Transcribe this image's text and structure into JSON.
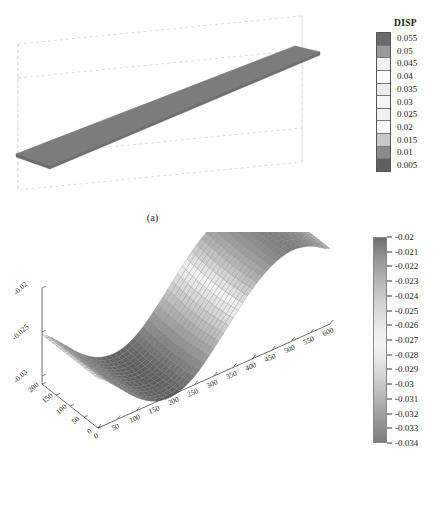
{
  "figure": {
    "panel_a": {
      "caption": "(a)",
      "legend": {
        "title": "DISP",
        "labels": [
          "0.055",
          "0.05",
          "0.045",
          "0.04",
          "0.035",
          "0.03",
          "0.025",
          "0.02",
          "0.015",
          "0.01",
          "0.005"
        ],
        "swatch_colors": [
          "#6b6b6b",
          "#9a9a9a",
          "#f2f2f2",
          "#fbfbfb",
          "#ededed",
          "#f6f6f6",
          "#f0f0f0",
          "#f9f9f9",
          "#c9c9c9",
          "#8a8a8a",
          "#5f5f5f"
        ]
      },
      "surface_color": "#7c7c7c",
      "box_line_color": "#d9d9d9"
    },
    "panel_b": {
      "caption": "(b)",
      "legend": {
        "labels": [
          "-0.02",
          "-0.021",
          "-0.022",
          "-0.023",
          "-0.024",
          "-0.025",
          "-0.026",
          "-0.027",
          "-0.028",
          "-0.029",
          "-0.03",
          "-0.031",
          "-0.032",
          "-0.033",
          "-0.034"
        ]
      },
      "axes": {
        "x_ticks": [
          "0",
          "50",
          "100",
          "150",
          "200",
          "250",
          "300",
          "350",
          "400",
          "450",
          "500",
          "550",
          "600"
        ],
        "y_ticks": [
          "0",
          "50",
          "100",
          "150",
          "200"
        ],
        "z_ticks": [
          "-0.02",
          "-0.025",
          "-0.03"
        ]
      }
    }
  },
  "chart_data": [
    {
      "type": "surface",
      "panel": "a",
      "title": "DISP",
      "description": "Undeformed flat plate strip rendered as a uniform gray surface inside a dashed 3D bounding box",
      "colorbar_label": "DISP",
      "colorbar_type": "banded",
      "colorbar_ticks": [
        0.055,
        0.05,
        0.045,
        0.04,
        0.035,
        0.03,
        0.025,
        0.02,
        0.015,
        0.01,
        0.005
      ],
      "value_range": [
        0.005,
        0.055
      ],
      "surface_uniform_value": 0.03
    },
    {
      "type": "surface",
      "panel": "b",
      "description": "3D wavy mesh surface (one full sine wave along x) colored by displacement",
      "xlabel": "",
      "ylabel": "",
      "zlabel": "",
      "x": [
        0,
        50,
        100,
        150,
        200,
        250,
        300,
        350,
        400,
        450,
        500,
        550,
        600
      ],
      "y": [
        0,
        50,
        100,
        150,
        200
      ],
      "xlim": [
        0,
        600
      ],
      "ylim": [
        0,
        200
      ],
      "zlim": [
        -0.034,
        -0.02
      ],
      "z_ticks": [
        -0.02,
        -0.025,
        -0.03
      ],
      "colorbar_type": "continuous",
      "colorbar_ticks": [
        -0.02,
        -0.021,
        -0.022,
        -0.023,
        -0.024,
        -0.025,
        -0.026,
        -0.027,
        -0.028,
        -0.029,
        -0.03,
        -0.031,
        -0.032,
        -0.033,
        -0.034
      ],
      "z_profile_along_x": [
        -0.0262,
        -0.0287,
        -0.0315,
        -0.0333,
        -0.0336,
        -0.0322,
        -0.0294,
        -0.0262,
        -0.0232,
        -0.0211,
        -0.0202,
        -0.0208,
        -0.0224
      ],
      "grid": true,
      "legend_position": "right"
    }
  ]
}
